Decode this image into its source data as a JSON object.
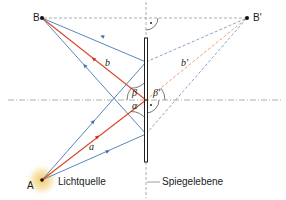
{
  "diagram": {
    "points": {
      "B": {
        "label": "B",
        "x": 42,
        "y": 18
      },
      "B_prime": {
        "label": "B'",
        "x": 247,
        "y": 18
      },
      "A": {
        "label": "A",
        "x": 42,
        "y": 180
      }
    },
    "labels": {
      "light_source": "Lichtquelle",
      "mirror_plane": "Spiegelebene",
      "ray_a": "a",
      "ray_b": "b",
      "ray_b_prime": "b'",
      "angle_alpha": "α",
      "angle_beta": "β",
      "angle_beta_prime": "β'"
    },
    "colors": {
      "red_ray": "#d9472b",
      "red_dashed": "#f0a070",
      "blue_ray": "#5b86b8",
      "blue_dashed": "#8aa5c8",
      "mirror": "#222222",
      "guide": "#999999",
      "glow": "#f3d58a"
    },
    "mirror": {
      "x": 146,
      "top": 38,
      "bottom": 162
    }
  }
}
